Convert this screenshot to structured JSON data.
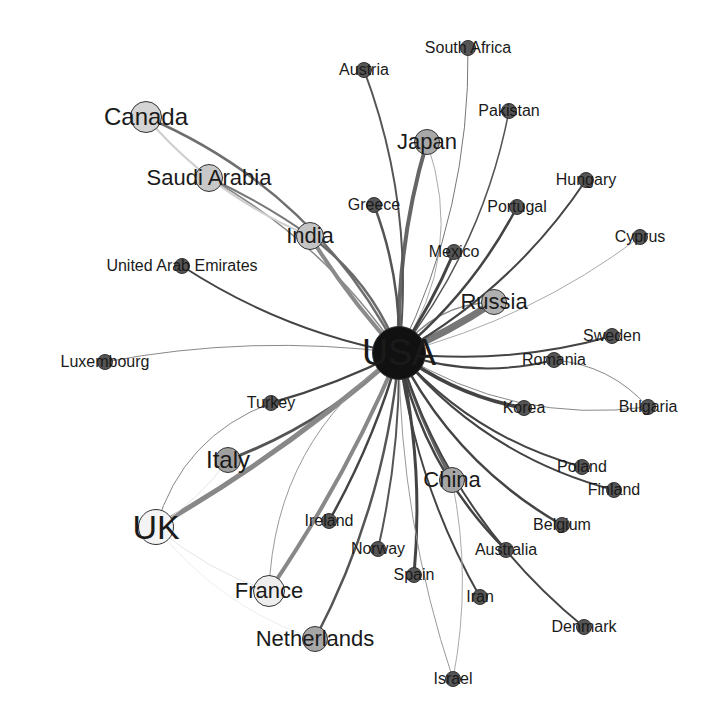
{
  "diagram": {
    "type": "network",
    "hub": "USA",
    "nodes": [
      {
        "id": "USA",
        "label": "USA",
        "x": 399,
        "y": 353,
        "r": 27,
        "fill": "#111111",
        "font": 36
      },
      {
        "id": "Canada",
        "label": "Canada",
        "x": 146,
        "y": 117,
        "r": 16,
        "fill": "#d4d4d4",
        "font": 24
      },
      {
        "id": "Saudi Arabia",
        "label": "Saudi Arabia",
        "x": 209,
        "y": 178,
        "r": 14,
        "fill": "#c8c8c8",
        "font": 22
      },
      {
        "id": "India",
        "label": "India",
        "x": 310,
        "y": 236,
        "r": 14,
        "fill": "#c4c4c4",
        "font": 22
      },
      {
        "id": "Japan",
        "label": "Japan",
        "x": 427,
        "y": 142,
        "r": 13,
        "fill": "#a8a8a8",
        "font": 22
      },
      {
        "id": "Russia",
        "label": "Russia",
        "x": 494,
        "y": 302,
        "r": 13,
        "fill": "#b0b0b0",
        "font": 22
      },
      {
        "id": "Italy",
        "label": "Italy",
        "x": 228,
        "y": 460,
        "r": 13,
        "fill": "#a0a0a0",
        "font": 24
      },
      {
        "id": "UK",
        "label": "UK",
        "x": 156,
        "y": 527,
        "r": 18,
        "fill": "#f4f4f4",
        "font": 34
      },
      {
        "id": "France",
        "label": "France",
        "x": 269,
        "y": 591,
        "r": 16,
        "fill": "#eeeeee",
        "font": 22
      },
      {
        "id": "Netherlands",
        "label": "Netherlands",
        "x": 315,
        "y": 639,
        "r": 13,
        "fill": "#a6a6a6",
        "font": 22
      },
      {
        "id": "China",
        "label": "China",
        "x": 452,
        "y": 480,
        "r": 13,
        "fill": "#a6a6a6",
        "font": 22
      },
      {
        "id": "Austria",
        "label": "Austria",
        "x": 364,
        "y": 70,
        "r": 8,
        "fill": "#555555",
        "font": 16
      },
      {
        "id": "South Africa",
        "label": "South Africa",
        "x": 468,
        "y": 48,
        "r": 8,
        "fill": "#555555",
        "font": 16
      },
      {
        "id": "Pakistan",
        "label": "Pakistan",
        "x": 509,
        "y": 111,
        "r": 8,
        "fill": "#555555",
        "font": 16
      },
      {
        "id": "Hungary",
        "label": "Hungary",
        "x": 586,
        "y": 180,
        "r": 8,
        "fill": "#555555",
        "font": 16
      },
      {
        "id": "Portugal",
        "label": "Portugal",
        "x": 517,
        "y": 207,
        "r": 8,
        "fill": "#555555",
        "font": 16
      },
      {
        "id": "Greece",
        "label": "Greece",
        "x": 374,
        "y": 205,
        "r": 8,
        "fill": "#555555",
        "font": 16
      },
      {
        "id": "Mexico",
        "label": "Mexico",
        "x": 454,
        "y": 252,
        "r": 8,
        "fill": "#555555",
        "font": 16
      },
      {
        "id": "Cyprus",
        "label": "Cyprus",
        "x": 640,
        "y": 237,
        "r": 8,
        "fill": "#555555",
        "font": 16
      },
      {
        "id": "United Arab Emirates",
        "label": "United Arab Emirates",
        "x": 182,
        "y": 266,
        "r": 8,
        "fill": "#555555",
        "font": 16
      },
      {
        "id": "Luxembourg",
        "label": "Luxembourg",
        "x": 105,
        "y": 362,
        "r": 8,
        "fill": "#555555",
        "font": 16
      },
      {
        "id": "Sweden",
        "label": "Sweden",
        "x": 612,
        "y": 336,
        "r": 8,
        "fill": "#555555",
        "font": 16
      },
      {
        "id": "Romania",
        "label": "Romania",
        "x": 554,
        "y": 360,
        "r": 8,
        "fill": "#555555",
        "font": 16
      },
      {
        "id": "Turkey",
        "label": "Turkey",
        "x": 271,
        "y": 403,
        "r": 8,
        "fill": "#555555",
        "font": 16
      },
      {
        "id": "Korea",
        "label": "Korea",
        "x": 524,
        "y": 408,
        "r": 8,
        "fill": "#555555",
        "font": 16
      },
      {
        "id": "Bulgaria",
        "label": "Bulgaria",
        "x": 648,
        "y": 407,
        "r": 8,
        "fill": "#555555",
        "font": 16
      },
      {
        "id": "Poland",
        "label": "Poland",
        "x": 582,
        "y": 467,
        "r": 8,
        "fill": "#555555",
        "font": 16
      },
      {
        "id": "Finland",
        "label": "Finland",
        "x": 614,
        "y": 490,
        "r": 8,
        "fill": "#555555",
        "font": 16
      },
      {
        "id": "Ireland",
        "label": "Ireland",
        "x": 329,
        "y": 521,
        "r": 8,
        "fill": "#555555",
        "font": 16
      },
      {
        "id": "Belgium",
        "label": "Belgium",
        "x": 562,
        "y": 525,
        "r": 8,
        "fill": "#555555",
        "font": 16
      },
      {
        "id": "Norway",
        "label": "Norway",
        "x": 378,
        "y": 549,
        "r": 8,
        "fill": "#555555",
        "font": 16
      },
      {
        "id": "Australia",
        "label": "Australia",
        "x": 506,
        "y": 550,
        "r": 8,
        "fill": "#555555",
        "font": 16
      },
      {
        "id": "Spain",
        "label": "Spain",
        "x": 414,
        "y": 575,
        "r": 8,
        "fill": "#555555",
        "font": 16
      },
      {
        "id": "Iran",
        "label": "Iran",
        "x": 480,
        "y": 597,
        "r": 8,
        "fill": "#555555",
        "font": 16
      },
      {
        "id": "Denmark",
        "label": "Denmark",
        "x": 584,
        "y": 627,
        "r": 8,
        "fill": "#555555",
        "font": 16
      },
      {
        "id": "Israel",
        "label": "Israel",
        "x": 453,
        "y": 679,
        "r": 8,
        "fill": "#555555",
        "font": 16
      }
    ],
    "edges": [
      {
        "from": "USA",
        "to": "Canada",
        "w": 2.5,
        "c": "#6e6e6e",
        "bend": 0.18
      },
      {
        "from": "USA",
        "to": "Saudi Arabia",
        "w": 1.5,
        "c": "#888888",
        "bend": 0.12
      },
      {
        "from": "USA",
        "to": "India",
        "w": 2.5,
        "c": "#6a6a6a",
        "bend": 0.15
      },
      {
        "from": "USA",
        "to": "India",
        "w": 4,
        "c": "#8a8a8a",
        "bend": -0.05
      },
      {
        "from": "USA",
        "to": "Japan",
        "w": 4,
        "c": "#666666",
        "bend": -0.08
      },
      {
        "from": "USA",
        "to": "Japan",
        "w": 1,
        "c": "#aaaaaa",
        "bend": 0.25
      },
      {
        "from": "USA",
        "to": "Russia",
        "w": 7,
        "c": "#777777",
        "bend": 0.05
      },
      {
        "from": "USA",
        "to": "Russia",
        "w": 1.5,
        "c": "#888888",
        "bend": -0.25
      },
      {
        "from": "USA",
        "to": "Italy",
        "w": 3,
        "c": "#555555",
        "bend": -0.1
      },
      {
        "from": "USA",
        "to": "UK",
        "w": 5,
        "c": "#888888",
        "bend": -0.05
      },
      {
        "from": "USA",
        "to": "France",
        "w": 4,
        "c": "#888888",
        "bend": -0.05
      },
      {
        "from": "USA",
        "to": "France",
        "w": 1,
        "c": "#999999",
        "bend": 0.25
      },
      {
        "from": "USA",
        "to": "Netherlands",
        "w": 2.5,
        "c": "#555555",
        "bend": -0.1
      },
      {
        "from": "USA",
        "to": "China",
        "w": 3,
        "c": "#666666",
        "bend": 0.05
      },
      {
        "from": "USA",
        "to": "Austria",
        "w": 2,
        "c": "#555555",
        "bend": 0.12
      },
      {
        "from": "USA",
        "to": "South Africa",
        "w": 1,
        "c": "#777777",
        "bend": 0.12
      },
      {
        "from": "USA",
        "to": "Pakistan",
        "w": 1.5,
        "c": "#555555",
        "bend": 0.12
      },
      {
        "from": "USA",
        "to": "Hungary",
        "w": 2,
        "c": "#444444",
        "bend": 0.12
      },
      {
        "from": "USA",
        "to": "Portugal",
        "w": 2.5,
        "c": "#444444",
        "bend": 0.1
      },
      {
        "from": "USA",
        "to": "Greece",
        "w": 2.5,
        "c": "#555555",
        "bend": 0.1
      },
      {
        "from": "USA",
        "to": "Mexico",
        "w": 3,
        "c": "#444444",
        "bend": 0.05
      },
      {
        "from": "USA",
        "to": "Cyprus",
        "w": 1,
        "c": "#aaaaaa",
        "bend": 0.1
      },
      {
        "from": "USA",
        "to": "United Arab Emirates",
        "w": 2,
        "c": "#444444",
        "bend": -0.1
      },
      {
        "from": "USA",
        "to": "Luxembourg",
        "w": 1,
        "c": "#888888",
        "bend": 0.08
      },
      {
        "from": "USA",
        "to": "Sweden",
        "w": 2,
        "c": "#444444",
        "bend": 0.1
      },
      {
        "from": "USA",
        "to": "Romania",
        "w": 2,
        "c": "#444444",
        "bend": 0.15
      },
      {
        "from": "USA",
        "to": "Turkey",
        "w": 2.5,
        "c": "#444444",
        "bend": -0.05
      },
      {
        "from": "USA",
        "to": "Korea",
        "w": 3.5,
        "c": "#444444",
        "bend": 0.12
      },
      {
        "from": "USA",
        "to": "Bulgaria",
        "w": 1,
        "c": "#888888",
        "bend": 0.18
      },
      {
        "from": "USA",
        "to": "Poland",
        "w": 2,
        "c": "#444444",
        "bend": 0.15
      },
      {
        "from": "USA",
        "to": "Finland",
        "w": 2,
        "c": "#444444",
        "bend": 0.16
      },
      {
        "from": "USA",
        "to": "Ireland",
        "w": 2.5,
        "c": "#444444",
        "bend": -0.06
      },
      {
        "from": "USA",
        "to": "Belgium",
        "w": 2.5,
        "c": "#444444",
        "bend": 0.15
      },
      {
        "from": "USA",
        "to": "Norway",
        "w": 2,
        "c": "#555555",
        "bend": -0.06
      },
      {
        "from": "USA",
        "to": "Australia",
        "w": 2.5,
        "c": "#444444",
        "bend": 0.15
      },
      {
        "from": "USA",
        "to": "Spain",
        "w": 3,
        "c": "#444444",
        "bend": -0.08
      },
      {
        "from": "USA",
        "to": "Iran",
        "w": 2,
        "c": "#444444",
        "bend": 0.1
      },
      {
        "from": "USA",
        "to": "Denmark",
        "w": 2,
        "c": "#444444",
        "bend": 0.15
      },
      {
        "from": "USA",
        "to": "Israel",
        "w": 1,
        "c": "#999999",
        "bend": 0.08
      },
      {
        "from": "Canada",
        "to": "India",
        "w": 2,
        "c": "#cfcfcf",
        "bend": 0.12
      },
      {
        "from": "Saudi Arabia",
        "to": "India",
        "w": 2,
        "c": "#777777",
        "bend": -0.05
      },
      {
        "from": "UK",
        "to": "Italy",
        "w": 1,
        "c": "#e6e6e6",
        "bend": 0.1
      },
      {
        "from": "UK",
        "to": "Turkey",
        "w": 1,
        "c": "#888888",
        "bend": -0.25
      },
      {
        "from": "UK",
        "to": "France",
        "w": 1,
        "c": "#e6e6e6",
        "bend": 0.1
      },
      {
        "from": "UK",
        "to": "Netherlands",
        "w": 1,
        "c": "#eeeeee",
        "bend": 0.15
      },
      {
        "from": "China",
        "to": "Israel",
        "w": 1,
        "c": "#aaaaaa",
        "bend": -0.1
      },
      {
        "from": "Romania",
        "to": "Bulgaria",
        "w": 1,
        "c": "#888888",
        "bend": -0.2
      }
    ]
  }
}
